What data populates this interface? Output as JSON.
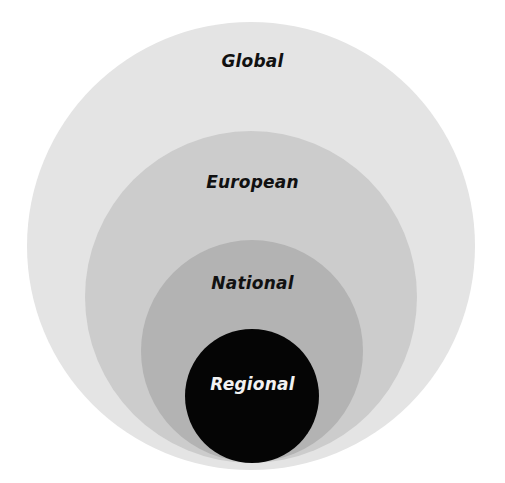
{
  "diagram": {
    "type": "nested-circles",
    "levels": [
      {
        "label": "Global",
        "fill": "#e4e4e4",
        "text_color": "#111111",
        "cx": 251,
        "cy": 246,
        "r": 224,
        "label_y": 62
      },
      {
        "label": "European",
        "fill": "#cccccc",
        "text_color": "#111111",
        "cx": 251,
        "cy": 297,
        "r": 166,
        "label_y": 183
      },
      {
        "label": "National",
        "fill": "#b3b3b3",
        "text_color": "#111111",
        "cx": 252,
        "cy": 351,
        "r": 111,
        "label_y": 284
      },
      {
        "label": "Regional",
        "fill": "#050505",
        "text_color": "#f2f2f2",
        "cx": 252,
        "cy": 396,
        "r": 67,
        "label_y": 385
      }
    ]
  }
}
